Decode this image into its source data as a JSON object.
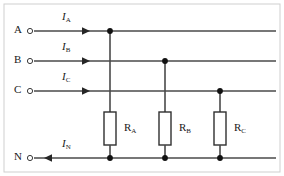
{
  "figure": {
    "kind": "three-phase-four-wire-circuit-diagram",
    "background_color": "#ffffff",
    "stroke_color": "#3a3a3a",
    "node_color": "#111111",
    "border_color": "#cfcfcf",
    "width": 284,
    "height": 176
  },
  "terminals": [
    {
      "label": "A",
      "x": 18,
      "y": 25,
      "node_x": 30,
      "node_y": 31
    },
    {
      "label": "B",
      "x": 18,
      "y": 55,
      "node_x": 30,
      "node_y": 61
    },
    {
      "label": "C",
      "x": 18,
      "y": 85,
      "node_x": 30,
      "node_y": 91
    },
    {
      "label": "N",
      "x": 18,
      "y": 152,
      "node_x": 30,
      "node_y": 158
    }
  ],
  "lines": [
    {
      "name": "phase-a",
      "y": 31,
      "x_start": 34,
      "x_end": 276
    },
    {
      "name": "phase-b",
      "y": 61,
      "x_start": 34,
      "x_end": 276
    },
    {
      "name": "phase-c",
      "y": 91,
      "x_start": 34,
      "x_end": 276
    },
    {
      "name": "neutral",
      "y": 158,
      "x_start": 34,
      "x_end": 276
    }
  ],
  "current_labels": [
    {
      "symbol": "I",
      "subscript": "A",
      "x": 58,
      "y": 10,
      "direction": "right",
      "arrow_x": 90,
      "arrow_y": 31
    },
    {
      "symbol": "I",
      "subscript": "B",
      "x": 58,
      "y": 40,
      "direction": "right",
      "arrow_x": 90,
      "arrow_y": 61
    },
    {
      "symbol": "I",
      "subscript": "C",
      "x": 58,
      "y": 70,
      "direction": "right",
      "arrow_x": 90,
      "arrow_y": 91
    },
    {
      "symbol": "I",
      "subscript": "N",
      "x": 58,
      "y": 137,
      "direction": "left",
      "arrow_x": 48,
      "arrow_y": 158
    }
  ],
  "resistors": [
    {
      "symbol": "R",
      "subscript": "A",
      "branch_x": 110,
      "box_top": 112,
      "box_bottom": 145,
      "box_width": 12,
      "connects_from_line": "phase-a",
      "top_y": 31,
      "bottom_y": 158,
      "label_x": 127,
      "label_y": 122
    },
    {
      "symbol": "R",
      "subscript": "B",
      "branch_x": 165,
      "box_top": 112,
      "box_bottom": 145,
      "box_width": 12,
      "connects_from_line": "phase-b",
      "top_y": 61,
      "bottom_y": 158,
      "label_x": 182,
      "label_y": 122
    },
    {
      "symbol": "R",
      "subscript": "C",
      "branch_x": 220,
      "box_top": 112,
      "box_bottom": 145,
      "box_width": 12,
      "connects_from_line": "phase-c",
      "top_y": 91,
      "bottom_y": 158,
      "label_x": 237,
      "label_y": 122
    }
  ],
  "junction_dots": [
    {
      "x": 110,
      "y": 31,
      "on": "phase-a"
    },
    {
      "x": 165,
      "y": 61,
      "on": "phase-b"
    },
    {
      "x": 220,
      "y": 91,
      "on": "phase-c"
    },
    {
      "x": 110,
      "y": 158,
      "on": "neutral"
    },
    {
      "x": 165,
      "y": 158,
      "on": "neutral"
    },
    {
      "x": 220,
      "y": 158,
      "on": "neutral"
    }
  ]
}
